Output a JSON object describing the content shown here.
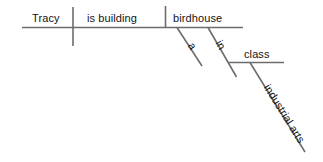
{
  "diagram": {
    "type": "sentence-diagram",
    "sentence": "Tracy is building a birdhouse in industrial arts class.",
    "canvas": {
      "width": 323,
      "height": 162,
      "background": "#ffffff"
    },
    "colors": {
      "line": "#6d6d6d",
      "text": "#141414"
    },
    "labels": {
      "subject": "Tracy",
      "verb": "is building",
      "direct_object": "birdhouse",
      "article": "a",
      "preposition": "in",
      "object_of_preposition": "class",
      "modifier": "industrial arts"
    }
  }
}
